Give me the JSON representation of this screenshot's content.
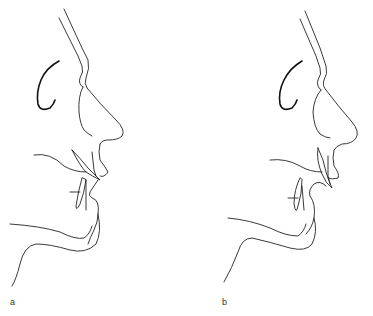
{
  "figure": {
    "panels": [
      {
        "id": "a",
        "label": "a",
        "description": "profile line drawing, pre-treatment"
      },
      {
        "id": "b",
        "label": "b",
        "description": "profile line drawing, post-treatment"
      }
    ],
    "colors": {
      "background": "#ffffff",
      "line": "#222222"
    }
  }
}
